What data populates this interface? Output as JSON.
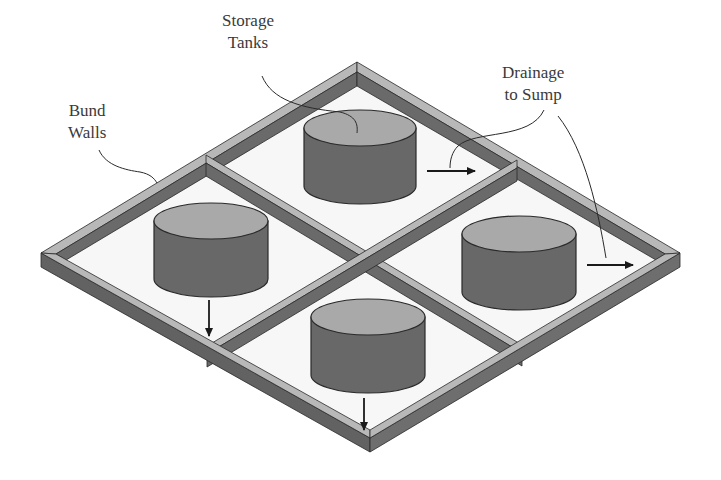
{
  "colors": {
    "background": "#ffffff",
    "wall_top": "#b8b8b8",
    "wall_side_dark": "#5f5f5f",
    "wall_side_mid": "#6e6e6e",
    "floor": "#f7f7f7",
    "tank_top": "#a9a9a9",
    "tank_body": "#686868",
    "outline": "#2a2a2a",
    "text": "#3a3a3a"
  },
  "labels": {
    "storage_tanks": {
      "line1": "Storage",
      "line2": "Tanks",
      "x": 222,
      "y": 10
    },
    "bund_walls": {
      "line1": "Bund",
      "line2": "Walls",
      "x": 68,
      "y": 100
    },
    "drainage": {
      "line1": "Drainage",
      "line2": "to Sump",
      "x": 502,
      "y": 62
    }
  },
  "tanks": [
    {
      "name": "tank-top",
      "cx": 360,
      "top_y": 128,
      "rx": 56,
      "ry": 18,
      "height": 58
    },
    {
      "name": "tank-left",
      "cx": 211,
      "top_y": 221,
      "rx": 57,
      "ry": 18,
      "height": 58
    },
    {
      "name": "tank-right",
      "cx": 519,
      "top_y": 234,
      "rx": 57,
      "ry": 18,
      "height": 58
    },
    {
      "name": "tank-bottom",
      "cx": 368,
      "top_y": 317,
      "rx": 57,
      "ry": 18,
      "height": 58
    }
  ],
  "drain_arrows": [
    {
      "name": "arrow-top-compartment",
      "x1": 427,
      "y1": 171,
      "x2": 475,
      "y2": 171
    },
    {
      "name": "arrow-right-compartment",
      "x1": 587,
      "y1": 265,
      "x2": 633,
      "y2": 265
    },
    {
      "name": "arrow-left-compartment",
      "x1": 209,
      "y1": 300,
      "x2": 209,
      "y2": 336
    },
    {
      "name": "arrow-bottom-compartment",
      "x1": 364,
      "y1": 398,
      "x2": 364,
      "y2": 430
    }
  ]
}
